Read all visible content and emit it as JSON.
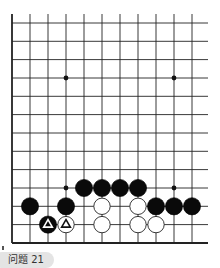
{
  "diagram": {
    "type": "go-board-fragment",
    "grid": {
      "columns_x": [
        12,
        30,
        48,
        66,
        84,
        102,
        120,
        138,
        156,
        174,
        192
      ],
      "rows_y": [
        23,
        41.3,
        59.6,
        78,
        96.3,
        114.6,
        133,
        151.3,
        169.6,
        188,
        206.3,
        224.6,
        243
      ],
      "right_extent": 208,
      "top_extent": 14,
      "left_edge": true,
      "bottom_edge": true,
      "line_color": "#222222"
    },
    "hoshi": [
      {
        "col": 3,
        "row": 3
      },
      {
        "col": 9,
        "row": 3
      },
      {
        "col": 3,
        "row": 9
      },
      {
        "col": 9,
        "row": 9
      }
    ],
    "stones": [
      {
        "color": "black",
        "col": 4,
        "row": 9
      },
      {
        "color": "black",
        "col": 5,
        "row": 9
      },
      {
        "color": "black",
        "col": 6,
        "row": 9
      },
      {
        "color": "black",
        "col": 7,
        "row": 9
      },
      {
        "color": "black",
        "col": 1,
        "row": 10
      },
      {
        "color": "black",
        "col": 3,
        "row": 10
      },
      {
        "color": "white",
        "col": 5,
        "row": 10
      },
      {
        "color": "white",
        "col": 7,
        "row": 10
      },
      {
        "color": "black",
        "col": 8,
        "row": 10
      },
      {
        "color": "black",
        "col": 9,
        "row": 10
      },
      {
        "color": "black",
        "col": 10,
        "row": 10
      },
      {
        "color": "black",
        "col": 2,
        "row": 11,
        "mark": "triangle"
      },
      {
        "color": "white",
        "col": 3,
        "row": 11,
        "mark": "triangle"
      },
      {
        "color": "white",
        "col": 5,
        "row": 11
      },
      {
        "color": "white",
        "col": 7,
        "row": 11
      },
      {
        "color": "white",
        "col": 8,
        "row": 11
      }
    ]
  },
  "caption": {
    "text": "问题 21"
  }
}
